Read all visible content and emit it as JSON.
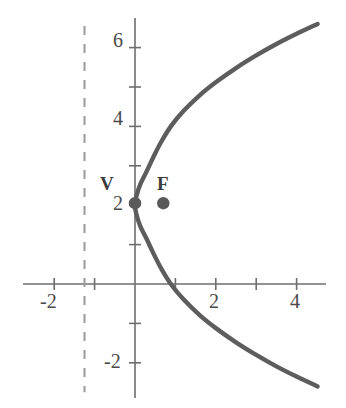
{
  "chart_data": {
    "type": "line",
    "title": "",
    "xlabel": "",
    "ylabel": "",
    "xlim": [
      -2.8,
      5.2
    ],
    "ylim": [
      -3.1,
      6.9
    ],
    "grid": false,
    "legend": null,
    "background_color": "#ffffff",
    "curve_color": "#5d5d5d",
    "axis_color": "#6e6e6e",
    "label_color": "#4a4a4a",
    "point_color": "#5a5a5a",
    "directrix_color": "#9a9a9a",
    "x_axis": {
      "tick_values": [
        -2,
        -1,
        1,
        2,
        3,
        4
      ],
      "tick_labels": [
        "-2",
        "",
        "",
        "2",
        "",
        "4"
      ],
      "labeled_ticks": [
        {
          "value": -2,
          "text": "-2"
        },
        {
          "value": 2,
          "text": "2"
        },
        {
          "value": 4,
          "text": "4"
        }
      ]
    },
    "y_axis": {
      "tick_values": [
        -2,
        -1,
        1,
        2,
        3,
        4,
        5,
        6
      ],
      "tick_labels": [
        "-2",
        "",
        "",
        "2",
        "",
        "4",
        "",
        "6"
      ],
      "labeled_ticks": [
        {
          "value": -2,
          "text": "-2"
        },
        {
          "value": 2,
          "text": "2"
        },
        {
          "value": 4,
          "text": "4"
        },
        {
          "value": 6,
          "text": "6"
        }
      ]
    },
    "series": [
      {
        "name": "parabola",
        "type": "curve",
        "equation": "x = 0.7 * (y - 2)^2 / 2.8",
        "points": [
          {
            "x": 4.52,
            "y": 6.6
          },
          {
            "x": 4.0,
            "y": 6.35
          },
          {
            "x": 3.5,
            "y": 6.09
          },
          {
            "x": 3.0,
            "y": 5.8
          },
          {
            "x": 2.5,
            "y": 5.48
          },
          {
            "x": 2.0,
            "y": 5.12
          },
          {
            "x": 1.6,
            "y": 4.79
          },
          {
            "x": 1.2,
            "y": 4.39
          },
          {
            "x": 0.9,
            "y": 4.02
          },
          {
            "x": 0.65,
            "y": 3.61
          },
          {
            "x": 0.45,
            "y": 3.21
          },
          {
            "x": 0.28,
            "y": 2.84
          },
          {
            "x": 0.13,
            "y": 2.53
          },
          {
            "x": 0.04,
            "y": 2.25
          },
          {
            "x": 0.0,
            "y": 2.0
          },
          {
            "x": 0.04,
            "y": 1.75
          },
          {
            "x": 0.13,
            "y": 1.47
          },
          {
            "x": 0.28,
            "y": 1.16
          },
          {
            "x": 0.45,
            "y": 0.79
          },
          {
            "x": 0.65,
            "y": 0.39
          },
          {
            "x": 0.9,
            "y": -0.02
          },
          {
            "x": 1.2,
            "y": -0.39
          },
          {
            "x": 1.6,
            "y": -0.79
          },
          {
            "x": 2.0,
            "y": -1.12
          },
          {
            "x": 2.5,
            "y": -1.48
          },
          {
            "x": 3.0,
            "y": -1.8
          },
          {
            "x": 3.5,
            "y": -2.09
          },
          {
            "x": 4.0,
            "y": -2.35
          },
          {
            "x": 4.52,
            "y": -2.6
          }
        ]
      }
    ],
    "annotations": [
      {
        "name": "vertex",
        "label": "V",
        "x": 0.0,
        "y": 2.05,
        "marker": "filled-circle",
        "label_offset": {
          "dx": -0.42,
          "dy": 0.62
        }
      },
      {
        "name": "focus",
        "label": "F",
        "x": 0.7,
        "y": 2.05,
        "marker": "filled-circle",
        "label_offset": {
          "dx": 0.0,
          "dy": 0.62
        }
      }
    ],
    "directrix": {
      "name": "directrix",
      "x": -1.25,
      "style": "dashed",
      "y_from": 6.55,
      "y_to": -2.75
    }
  },
  "labels": {
    "x_neg2": "-2",
    "x_pos2": "2",
    "x_pos4": "4",
    "y_neg2": "-2",
    "y_pos2": "2",
    "y_pos4": "4",
    "y_pos6": "6",
    "vertex": "V",
    "focus": "F"
  }
}
